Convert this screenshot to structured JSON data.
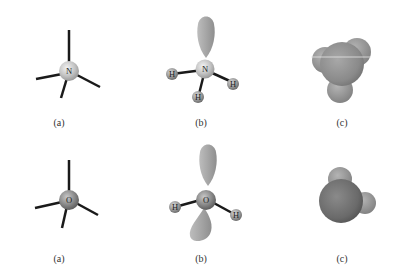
{
  "figure": {
    "rows": [
      {
        "central_atom": "N",
        "panels": [
          {
            "id": "a",
            "label": "(a)",
            "type": "tetrahedral-bonds",
            "center_label": "N"
          },
          {
            "id": "b",
            "label": "(b)",
            "type": "ball-and-stick-with-lone-pair",
            "center_label": "N",
            "ligands": [
              "H",
              "H",
              "H"
            ],
            "lone_pairs": 1
          },
          {
            "id": "c",
            "label": "(c)",
            "type": "space-filling"
          }
        ]
      },
      {
        "central_atom": "O",
        "panels": [
          {
            "id": "a",
            "label": "(a)",
            "type": "tetrahedral-bonds",
            "center_label": "O"
          },
          {
            "id": "b",
            "label": "(b)",
            "type": "ball-and-stick-with-lone-pairs",
            "center_label": "O",
            "ligands": [
              "H",
              "H"
            ],
            "lone_pairs": 2
          },
          {
            "id": "c",
            "label": "(c)",
            "type": "space-filling"
          }
        ]
      }
    ]
  },
  "labels": {
    "r1a": "(a)",
    "r1b": "(b)",
    "r1c": "(c)",
    "r2a": "(a)",
    "r2b": "(b)",
    "r2c": "(c)",
    "n": "N",
    "o": "O",
    "h": "H"
  },
  "colors": {
    "background": "#ffffff",
    "bond": "#1a1a1a",
    "nitrogen": "#c8c8c8",
    "oxygen": "#8a8a8a",
    "hydrogen": "#9a9a9a",
    "lobe": "#a8a8a8",
    "space_fill": "#8c8c8c"
  }
}
